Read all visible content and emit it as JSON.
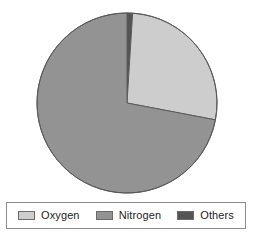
{
  "chart_data": {
    "type": "pie",
    "title": "",
    "categories": [
      "Oxygen",
      "Nitrogen",
      "Others"
    ],
    "values": [
      27,
      72,
      1
    ],
    "unit": "%",
    "legend_position": "bottom",
    "grid": false,
    "start_angle_deg": 0,
    "direction": "clockwise",
    "slices": [
      {
        "label": "Others",
        "value": 1,
        "color": "#545454",
        "start_angle_deg": 0,
        "end_angle_deg": 3.6
      },
      {
        "label": "Oxygen",
        "value": 27,
        "color": "#cdcdcd",
        "start_angle_deg": 3.6,
        "end_angle_deg": 100.8
      },
      {
        "label": "Nitrogen",
        "value": 72,
        "color": "#939393",
        "start_angle_deg": 100.8,
        "end_angle_deg": 360
      }
    ]
  },
  "pie": {
    "center_x": 127,
    "center_y": 103,
    "radius": 90,
    "outline_color": "#5a5a5a"
  },
  "legend": {
    "border_color": "#8d8d8d",
    "background": "#ffffff",
    "items": [
      {
        "label": "Oxygen",
        "color": "#cdcdcd"
      },
      {
        "label": "Nitrogen",
        "color": "#939393"
      },
      {
        "label": "Others",
        "color": "#545454"
      }
    ]
  }
}
